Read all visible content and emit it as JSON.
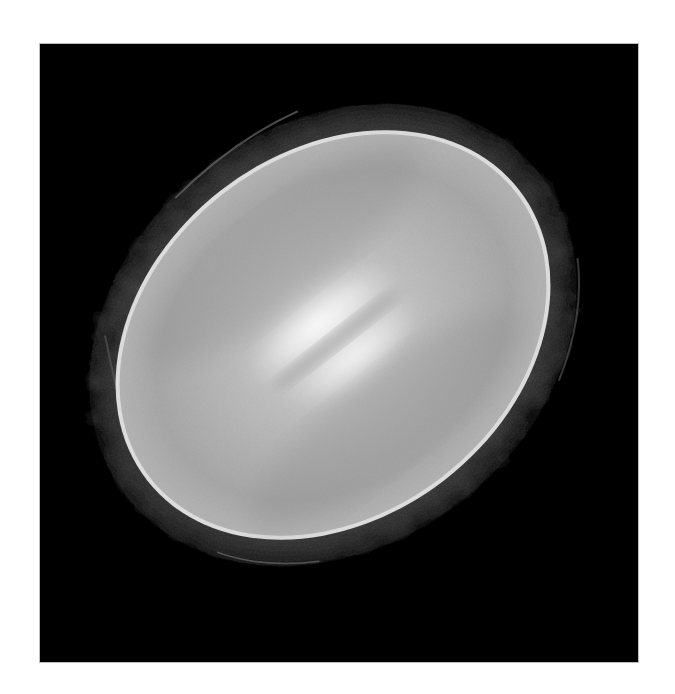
{
  "image": {
    "subject": "Mother-of-pearl shell interior photographed on black background",
    "alt_text": "Oval pearly shell with iridescent interior and rough dark outer rim",
    "frame": {
      "border_color": "#ffffff",
      "background_color": "#000000"
    },
    "shell": {
      "nacre_base_color": "#a9a9a9",
      "nacre_highlight_color": "#f4f4f4",
      "nacre_rim_color": "#d8d8d8",
      "outer_rim_color": "#2a2a2a",
      "rotation_deg": -38
    }
  }
}
